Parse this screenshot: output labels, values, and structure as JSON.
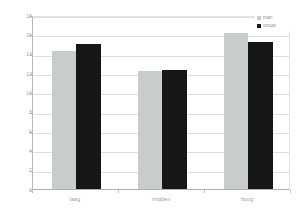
{
  "chart_data": {
    "type": "bar",
    "title": "",
    "xlabel": "",
    "ylabel": "",
    "categories": [
      "laag",
      "midden",
      "hoog"
    ],
    "series": [
      {
        "name": "man",
        "color": "#c8cccb",
        "values": [
          14.3,
          12.2,
          16.1
        ]
      },
      {
        "name": "vrouw",
        "color": "#161616",
        "values": [
          15.0,
          12.3,
          15.2
        ]
      }
    ],
    "ylim": [
      0,
      18
    ],
    "ytick_values": [
      0,
      2,
      4,
      6,
      8,
      10,
      12,
      14,
      16,
      18
    ],
    "ytick_labels": [
      "0",
      "2",
      "4",
      "6",
      "8",
      "10",
      "12",
      "14",
      "16",
      "18"
    ],
    "grid": true,
    "legend_position": "top-right",
    "legend_entries": [
      "man",
      "vrouw"
    ]
  },
  "legend": {
    "items": [
      {
        "label": "man"
      },
      {
        "label": "vrouw"
      }
    ]
  },
  "axes": {
    "y_labels": [
      "18",
      "16",
      "14",
      "12",
      "10",
      "8",
      "6",
      "4",
      "2",
      "0"
    ],
    "x_labels": [
      "laag",
      "midden",
      "hoog"
    ]
  }
}
